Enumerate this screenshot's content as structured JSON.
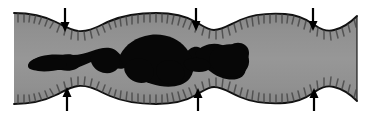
{
  "figure": {
    "width": 366,
    "height": 117,
    "background_color": "#ffffff",
    "caption": ""
  },
  "colors": {
    "background": "#ffffff",
    "tube_wall_fill": "#8e8e8e",
    "tube_wall_fill_light": "#9a9a9a",
    "tube_outline": "#121212",
    "hatch_marks": "#3c3c3c",
    "internal_mass": "#070707",
    "arrow": "#000000"
  },
  "elements": {
    "tube": {
      "name": "tube-body",
      "label": "segmented tube wall",
      "left_edge_x": 14,
      "right_edge_x": 357,
      "top_edge_y": 13,
      "bottom_edge_y": 110,
      "segments": 4,
      "constriction_count": 3
    },
    "mass": {
      "name": "internal-mass",
      "label": "dark internal mass",
      "start_x": 28,
      "end_x": 249,
      "center_y": 62,
      "max_thickness": 46
    },
    "hatching": {
      "name": "inner-lining-hatching",
      "label": "short radial tick marks lining inner tube wall",
      "tick_length": 9,
      "tick_width": 1.4
    }
  },
  "arrows": {
    "label": "constriction indicator arrows",
    "top": [
      {
        "name": "constriction-arrow-top-1",
        "x": 65,
        "y_tail": 8,
        "y_head": 31,
        "direction": "down"
      },
      {
        "name": "constriction-arrow-top-2",
        "x": 196,
        "y_tail": 8,
        "y_head": 30,
        "direction": "down"
      },
      {
        "name": "constriction-arrow-top-3",
        "x": 313,
        "y_tail": 8,
        "y_head": 30,
        "direction": "down"
      }
    ],
    "bottom": [
      {
        "name": "constriction-arrow-bottom-1",
        "x": 67,
        "y_tail": 110,
        "y_head": 88,
        "direction": "up"
      },
      {
        "name": "constriction-arrow-bottom-2",
        "x": 198,
        "y_tail": 110,
        "y_head": 89,
        "direction": "up"
      },
      {
        "name": "constriction-arrow-bottom-3",
        "x": 314,
        "y_tail": 110,
        "y_head": 89,
        "direction": "up"
      }
    ],
    "head_width": 9,
    "head_length": 11,
    "stem_width": 2.2
  }
}
